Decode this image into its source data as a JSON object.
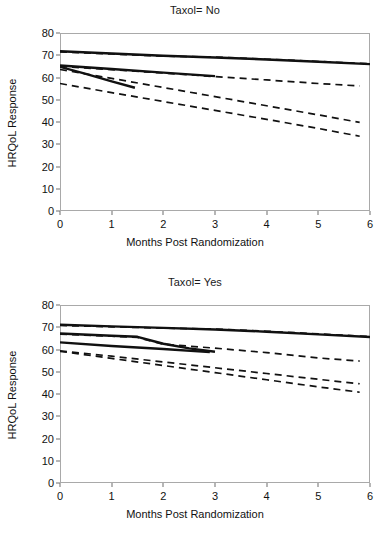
{
  "figure": {
    "panels": [
      {
        "title": "Taxol= No",
        "xlabel": "Months Post Randomization",
        "ylabel": "HRQoL Response"
      },
      {
        "title": "Taxol= Yes",
        "xlabel": "Months Post Randomization",
        "ylabel": "HRQoL Response"
      }
    ]
  },
  "chart_data": [
    {
      "type": "line",
      "title": "Taxol= No",
      "xlabel": "Months Post Randomization",
      "ylabel": "HRQoL Response",
      "xlim": [
        0,
        6
      ],
      "ylim": [
        0,
        80
      ],
      "xticks": [
        0,
        1,
        2,
        3,
        4,
        5,
        6
      ],
      "yticks": [
        0,
        10,
        20,
        30,
        40,
        50,
        60,
        70,
        80
      ],
      "grid": false,
      "legend": "none",
      "series": [
        {
          "name": "Group 1 observed",
          "style": "solid",
          "x": [
            0,
            1,
            2,
            3,
            4,
            5,
            6
          ],
          "values": [
            71.8,
            70.8,
            69.8,
            69.0,
            68.1,
            67.1,
            66.0
          ]
        },
        {
          "name": "Group 1 projected",
          "style": "dashed",
          "x": [
            0,
            1,
            2,
            3,
            4,
            5,
            6
          ],
          "values": [
            71.5,
            70.6,
            69.6,
            69.2,
            68.2,
            67.2,
            66.2
          ]
        },
        {
          "name": "Group 2 observed",
          "style": "solid",
          "x": [
            0,
            1,
            2,
            3
          ],
          "values": [
            65.4,
            63.8,
            62.2,
            60.6
          ]
        },
        {
          "name": "Group 2 projected",
          "style": "dashed",
          "x": [
            0,
            1,
            2,
            3,
            4,
            5,
            5.8
          ],
          "values": [
            65.0,
            63.5,
            62.0,
            60.4,
            58.9,
            57.3,
            56.2
          ]
        },
        {
          "name": "Group 3 observed",
          "style": "solid",
          "x": [
            0,
            0.5,
            1,
            1.45
          ],
          "values": [
            64.8,
            61.6,
            58.3,
            55.4
          ]
        },
        {
          "name": "Group 3 projected",
          "style": "dashed",
          "x": [
            0,
            1,
            2,
            3,
            4,
            5,
            5.8
          ],
          "values": [
            63.6,
            59.6,
            55.5,
            51.4,
            47.3,
            43.2,
            39.8
          ]
        },
        {
          "name": "Group 4 projected",
          "style": "dashed",
          "x": [
            0,
            1,
            2,
            3,
            4,
            5,
            5.8
          ],
          "values": [
            57.3,
            53.2,
            49.2,
            45.2,
            41.2,
            37.1,
            33.6
          ]
        }
      ]
    },
    {
      "type": "line",
      "title": "Taxol= Yes",
      "xlabel": "Months Post Randomization",
      "ylabel": "HRQoL Response",
      "xlim": [
        0,
        6
      ],
      "ylim": [
        0,
        80
      ],
      "xticks": [
        0,
        1,
        2,
        3,
        4,
        5,
        6
      ],
      "yticks": [
        0,
        10,
        20,
        30,
        40,
        50,
        60,
        70,
        80
      ],
      "grid": false,
      "legend": "none",
      "series": [
        {
          "name": "Group 1 observed",
          "style": "solid",
          "x": [
            0,
            1,
            2,
            3,
            4,
            5,
            6
          ],
          "values": [
            71.1,
            70.4,
            69.7,
            69.0,
            68.0,
            66.8,
            65.6
          ]
        },
        {
          "name": "Group 1 projected",
          "style": "dashed",
          "x": [
            0,
            1,
            2,
            3,
            4,
            5,
            6
          ],
          "values": [
            70.8,
            70.2,
            69.6,
            69.2,
            68.2,
            67.0,
            65.8
          ]
        },
        {
          "name": "Group 2 observed",
          "style": "solid",
          "x": [
            0,
            1,
            1.5,
            2,
            2.5,
            3
          ],
          "values": [
            67.2,
            66.2,
            65.7,
            62.6,
            60.5,
            59.0
          ]
        },
        {
          "name": "Group 2 projected",
          "style": "dashed",
          "x": [
            0,
            1,
            1.5,
            2,
            3,
            4,
            5,
            5.8
          ],
          "values": [
            66.9,
            66.0,
            65.4,
            62.4,
            60.6,
            58.6,
            56.2,
            54.8
          ]
        },
        {
          "name": "Group 3 observed",
          "style": "solid",
          "x": [
            0,
            1,
            2,
            2.9
          ],
          "values": [
            63.2,
            61.6,
            60.2,
            58.8
          ]
        },
        {
          "name": "Group 3 projected",
          "style": "dashed",
          "x": [
            0,
            1,
            2,
            3,
            4,
            5,
            5.8
          ],
          "values": [
            59.4,
            57.0,
            54.4,
            51.8,
            49.2,
            46.6,
            44.6
          ]
        },
        {
          "name": "Group 4 projected",
          "style": "dashed",
          "x": [
            0,
            1,
            2,
            3,
            4,
            5,
            5.8
          ],
          "values": [
            59.2,
            56.0,
            52.8,
            49.6,
            46.4,
            43.2,
            40.8
          ]
        }
      ]
    }
  ]
}
